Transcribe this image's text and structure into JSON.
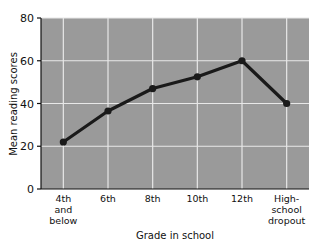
{
  "chart_data": {
    "type": "line",
    "title": "",
    "xlabel": "Grade in school",
    "ylabel": "Mean reading scores",
    "categories": [
      "4th and below",
      "6th",
      "8th",
      "10th",
      "12th",
      "High-school dropout"
    ],
    "category_lines": [
      [
        "4th",
        "and",
        "below"
      ],
      [
        "6th"
      ],
      [
        "8th"
      ],
      [
        "10th"
      ],
      [
        "12th"
      ],
      [
        "High-",
        "school",
        "dropout"
      ]
    ],
    "values": [
      22,
      36.5,
      47,
      52.5,
      60,
      40
    ],
    "ylim": [
      0,
      80
    ],
    "yticks": [
      0,
      20,
      40,
      60,
      80
    ],
    "ytick_labels": [
      "0",
      "20",
      "40",
      "60",
      "80"
    ],
    "grid": true,
    "legend": "none",
    "marker": "circle",
    "colors": {
      "plot_background": "#9a9a9a",
      "page_background": "#ffffff",
      "grid": "#e8e8e8",
      "line": "#1a1a1a",
      "marker": "#1a1a1a",
      "axis": "#111111",
      "text": "#111111"
    }
  }
}
